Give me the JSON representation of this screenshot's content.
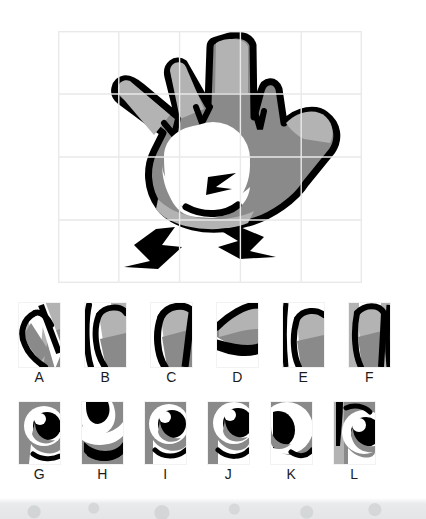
{
  "worksheet": {
    "title": "Picture grid puzzle — find the matching piece",
    "type": "visual-matching-puzzle"
  },
  "colors": {
    "outline": "#000000",
    "body_gray": "#8a8a8a",
    "highlight_gray": "#b3b3b3",
    "shadow_gray": "#767676",
    "white": "#ffffff",
    "grid_line": "#e9e9e9",
    "label_text": "#1b1b1b",
    "watermark": "#e3e5e6"
  },
  "main_image": {
    "subject": "cartoon hand character with four fingers, thumb, one large eye and two legs",
    "grid": {
      "columns": 5,
      "rows": 4,
      "line_color": "#e9e9e9",
      "visible": true
    },
    "position": {
      "x": 58,
      "y": 31,
      "width": 304,
      "height": 252
    }
  },
  "tiles_top": [
    {
      "label": "A",
      "content": "finger-fragment-a"
    },
    {
      "label": "B",
      "content": "finger-fragment-b"
    },
    {
      "label": "C",
      "content": "finger-fragment-c"
    },
    {
      "label": "D",
      "content": "finger-fragment-d"
    },
    {
      "label": "E",
      "content": "finger-fragment-e"
    },
    {
      "label": "F",
      "content": "finger-fragment-f"
    }
  ],
  "tiles_bottom": [
    {
      "label": "G",
      "content": "eye-fragment-g"
    },
    {
      "label": "H",
      "content": "eye-fragment-h"
    },
    {
      "label": "I",
      "content": "eye-fragment-i"
    },
    {
      "label": "J",
      "content": "eye-fragment-j"
    },
    {
      "label": "K",
      "content": "eye-fragment-k"
    },
    {
      "label": "L",
      "content": "eye-fragment-l"
    }
  ]
}
